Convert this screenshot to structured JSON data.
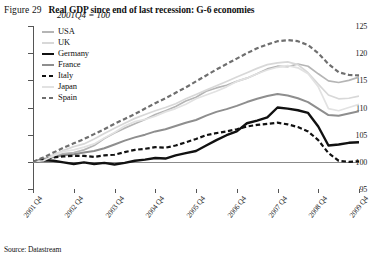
{
  "figure": {
    "number": "Figure 29",
    "title": "Real GDP since end of last recession: G-6 economies",
    "subtitle": "2001Q4 = 100",
    "source": "Source: Datastream"
  },
  "chart_data": {
    "type": "line",
    "title": "Real GDP since end of last recession: G-6 economies",
    "subtitle": "2001Q4 = 100",
    "xlabel": "",
    "ylabel": "",
    "ylim": [
      95,
      125
    ],
    "yticks": [
      95,
      100,
      105,
      110,
      115,
      120,
      125
    ],
    "grid": false,
    "legend_position": "top-left",
    "reference_line": 100,
    "categories": [
      "2001 Q4",
      "2002 Q1",
      "2002 Q2",
      "2002 Q3",
      "2002 Q4",
      "2003 Q1",
      "2003 Q2",
      "2003 Q3",
      "2003 Q4",
      "2004 Q1",
      "2004 Q2",
      "2004 Q3",
      "2004 Q4",
      "2005 Q1",
      "2005 Q2",
      "2005 Q3",
      "2005 Q4",
      "2006 Q1",
      "2006 Q2",
      "2006 Q3",
      "2006 Q4",
      "2007 Q1",
      "2007 Q2",
      "2007 Q3",
      "2007 Q4",
      "2008 Q1",
      "2008 Q2",
      "2008 Q3",
      "2008 Q4",
      "2009 Q1",
      "2009 Q2",
      "2009 Q3",
      "2009 Q4"
    ],
    "xticks": [
      "2001 Q4",
      "2002 Q4",
      "2003 Q4",
      "2004 Q4",
      "2005 Q4",
      "2006 Q4",
      "2007 Q4",
      "2008 Q4",
      "2009 Q4"
    ],
    "series": [
      {
        "name": "USA",
        "color": "#b5b5b5",
        "style": "solid",
        "width": 1.7,
        "values": [
          100.0,
          100.5,
          101.0,
          101.5,
          101.7,
          102.2,
          103.0,
          104.3,
          105.3,
          106.2,
          107.0,
          107.8,
          108.7,
          109.4,
          110.2,
          111.2,
          111.9,
          113.0,
          113.6,
          114.1,
          114.8,
          115.4,
          116.2,
          117.1,
          117.6,
          117.5,
          118.0,
          117.6,
          116.2,
          114.9,
          114.6,
          115.0,
          115.6
        ]
      },
      {
        "name": "UK",
        "color": "#d8d8d8",
        "style": "solid",
        "width": 1.7,
        "values": [
          100.0,
          100.6,
          101.3,
          102.1,
          102.8,
          103.3,
          104.2,
          105.2,
          106.2,
          107.1,
          108.0,
          108.7,
          109.4,
          110.0,
          110.7,
          111.6,
          112.4,
          113.2,
          114.0,
          114.8,
          115.6,
          116.4,
          117.2,
          117.9,
          118.2,
          118.4,
          117.9,
          116.4,
          114.3,
          112.3,
          111.6,
          111.7,
          112.1
        ]
      },
      {
        "name": "Germany",
        "color": "#111111",
        "style": "solid",
        "width": 2.4,
        "values": [
          100.0,
          100.3,
          100.2,
          99.9,
          99.6,
          99.9,
          99.6,
          99.8,
          99.5,
          99.8,
          100.2,
          100.4,
          100.7,
          100.6,
          101.2,
          101.6,
          102.0,
          103.0,
          104.0,
          104.9,
          105.6,
          107.1,
          107.6,
          108.2,
          110.0,
          109.8,
          109.5,
          109.0,
          106.5,
          103.0,
          103.2,
          103.5,
          103.6
        ]
      },
      {
        "name": "France",
        "color": "#8e8e8e",
        "style": "solid",
        "width": 2.0,
        "values": [
          100.0,
          100.4,
          100.9,
          101.2,
          101.4,
          101.7,
          102.0,
          102.5,
          103.2,
          103.9,
          104.5,
          105.0,
          105.6,
          106.0,
          106.6,
          107.2,
          107.7,
          108.5,
          109.2,
          109.7,
          110.3,
          111.0,
          111.6,
          112.1,
          112.5,
          112.2,
          111.7,
          111.0,
          109.8,
          108.6,
          108.5,
          108.9,
          109.3
        ]
      },
      {
        "name": "Italy",
        "color": "#111111",
        "style": "dashed",
        "width": 2.2,
        "values": [
          100.0,
          100.4,
          100.8,
          101.0,
          101.1,
          101.1,
          100.9,
          101.2,
          101.3,
          101.8,
          102.2,
          102.4,
          102.7,
          102.6,
          103.0,
          103.6,
          104.2,
          104.9,
          105.3,
          105.6,
          106.0,
          106.5,
          106.8,
          107.0,
          107.2,
          106.9,
          106.4,
          105.6,
          104.0,
          101.6,
          100.2,
          100.0,
          100.1
        ]
      },
      {
        "name": "Japan",
        "color": "#e2e2e2",
        "style": "solid",
        "width": 1.7,
        "values": [
          100.0,
          100.2,
          101.1,
          101.9,
          102.2,
          102.7,
          103.3,
          104.4,
          105.4,
          106.6,
          107.4,
          107.8,
          108.4,
          109.2,
          109.8,
          110.6,
          111.6,
          112.3,
          113.0,
          113.8,
          114.8,
          115.4,
          116.2,
          116.9,
          117.4,
          117.7,
          117.3,
          116.2,
          113.8,
          109.8,
          109.4,
          110.0,
          110.6
        ]
      },
      {
        "name": "Spain",
        "color": "#6f6f6f",
        "style": "dashed",
        "width": 2.2,
        "values": [
          100.0,
          100.8,
          101.7,
          102.6,
          103.4,
          104.2,
          105.1,
          106.0,
          107.0,
          107.9,
          108.8,
          109.8,
          110.8,
          111.7,
          112.7,
          113.7,
          114.8,
          115.9,
          117.0,
          118.0,
          119.0,
          120.0,
          120.9,
          121.6,
          122.2,
          122.4,
          122.2,
          121.5,
          120.0,
          118.0,
          116.5,
          116.0,
          115.9
        ]
      }
    ]
  }
}
